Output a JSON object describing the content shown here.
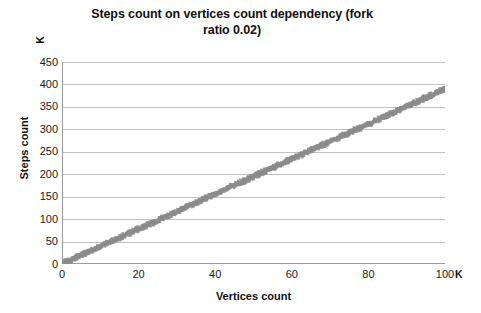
{
  "chart_data": {
    "type": "scatter",
    "title": "Steps count on vertices count dependency (fork ratio 0.02)",
    "title_line1": "Steps count on vertices count dependency (fork",
    "title_line2": "ratio 0.02)",
    "xlabel": "Vertices count",
    "ylabel": "Steps count",
    "x_unit": "K",
    "y_unit": "K",
    "xlim": [
      0,
      100
    ],
    "ylim": [
      0,
      450
    ],
    "x_ticks": [
      0,
      20,
      40,
      60,
      80,
      100
    ],
    "y_ticks": [
      0,
      50,
      100,
      150,
      200,
      250,
      300,
      350,
      400,
      450
    ],
    "x_tick_labels": [
      "0",
      "20",
      "40",
      "60",
      "80",
      "100"
    ],
    "y_tick_labels": [
      "0",
      "50",
      "100",
      "150",
      "200",
      "250",
      "300",
      "350",
      "400",
      "450"
    ],
    "grid": {
      "horizontal": true,
      "vertical": false,
      "color": "#b0b0b0"
    },
    "legend": null,
    "marker_color": "#8c8c8c",
    "series": [
      {
        "name": "Steps count",
        "description": "Dense linear band of scatter markers rising from the origin",
        "trend": "linear",
        "slope": 3.9,
        "intercept": 0,
        "x": [
          0,
          5,
          10,
          15,
          20,
          25,
          30,
          35,
          40,
          45,
          50,
          55,
          60,
          65,
          70,
          75,
          80,
          85,
          90,
          95,
          100
        ],
        "values": [
          0,
          20,
          39,
          58,
          78,
          97,
          117,
          137,
          156,
          176,
          195,
          215,
          234,
          253,
          273,
          292,
          312,
          331,
          351,
          370,
          390
        ]
      }
    ]
  }
}
